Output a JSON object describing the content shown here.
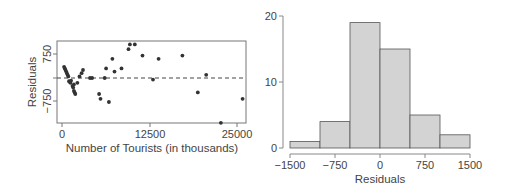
{
  "chart_data": [
    {
      "type": "scatter",
      "title": "",
      "xlabel": "Number of Tourists (in thousands)",
      "ylabel": "Residuals",
      "xticks": [
        "0",
        "12500",
        "25000"
      ],
      "yticks": [
        "-750",
        "750"
      ],
      "xlim": [
        -1000,
        26500
      ],
      "ylim": [
        -1400,
        1100
      ],
      "reference_line": {
        "y": 0,
        "style": "dashed"
      },
      "grid": false,
      "points": [
        {
          "x": 300,
          "y": 350
        },
        {
          "x": 400,
          "y": 300
        },
        {
          "x": 500,
          "y": 250
        },
        {
          "x": 600,
          "y": 200
        },
        {
          "x": 700,
          "y": 150
        },
        {
          "x": 800,
          "y": 100
        },
        {
          "x": 900,
          "y": 50
        },
        {
          "x": 1000,
          "y": -100
        },
        {
          "x": 1100,
          "y": -120
        },
        {
          "x": 1200,
          "y": -150
        },
        {
          "x": 1300,
          "y": -80
        },
        {
          "x": 1500,
          "y": -250
        },
        {
          "x": 1600,
          "y": -300
        },
        {
          "x": 1700,
          "y": -400
        },
        {
          "x": 1800,
          "y": -450
        },
        {
          "x": 1900,
          "y": -500
        },
        {
          "x": 1700,
          "y": -200
        },
        {
          "x": 2200,
          "y": -150
        },
        {
          "x": 2500,
          "y": 50
        },
        {
          "x": 2800,
          "y": 150
        },
        {
          "x": 3000,
          "y": 250
        },
        {
          "x": 4000,
          "y": 0
        },
        {
          "x": 4300,
          "y": 0
        },
        {
          "x": 5300,
          "y": -500
        },
        {
          "x": 5500,
          "y": -650
        },
        {
          "x": 6300,
          "y": 300
        },
        {
          "x": 6100,
          "y": 0
        },
        {
          "x": 6700,
          "y": -750
        },
        {
          "x": 7200,
          "y": 600
        },
        {
          "x": 7500,
          "y": 200
        },
        {
          "x": 8500,
          "y": 300
        },
        {
          "x": 9500,
          "y": 900
        },
        {
          "x": 9700,
          "y": 1050
        },
        {
          "x": 10400,
          "y": 1050
        },
        {
          "x": 11500,
          "y": 700
        },
        {
          "x": 13000,
          "y": -50
        },
        {
          "x": 13800,
          "y": 600
        },
        {
          "x": 17200,
          "y": 700
        },
        {
          "x": 19400,
          "y": -450
        },
        {
          "x": 20600,
          "y": 100
        },
        {
          "x": 22700,
          "y": -1400
        },
        {
          "x": 25800,
          "y": -650
        }
      ]
    },
    {
      "type": "bar",
      "subtype": "histogram",
      "title": "",
      "xlabel": "Residuals",
      "ylabel": "",
      "categories": [
        "-1500 to -1000",
        "-1000 to -500",
        "-500 to 0",
        "0 to 500",
        "500 to 1000",
        "1000 to 1500"
      ],
      "bin_edges": [
        -1500,
        -1000,
        -500,
        0,
        500,
        1000,
        1500
      ],
      "values": [
        1,
        4,
        19,
        15,
        5,
        2
      ],
      "xticks": [
        "-1500",
        "-750",
        "0",
        "750",
        "1500"
      ],
      "yticks": [
        "0",
        "10",
        "20"
      ],
      "ylim": [
        0,
        20
      ],
      "grid": false,
      "bar_color": "#d3d3d3"
    }
  ],
  "labels": {
    "scatter_xlabel": "Number of Tourists (in thousands)",
    "scatter_ylabel": "Residuals",
    "scatter_xticks": [
      "0",
      "12500",
      "25000"
    ],
    "scatter_yticks": [
      "750",
      "−750"
    ],
    "hist_xlabel": "Residuals",
    "hist_xticks": [
      "−1500",
      "−750",
      "0",
      "750",
      "1500"
    ],
    "hist_yticks": [
      "0",
      "10",
      "20"
    ]
  }
}
